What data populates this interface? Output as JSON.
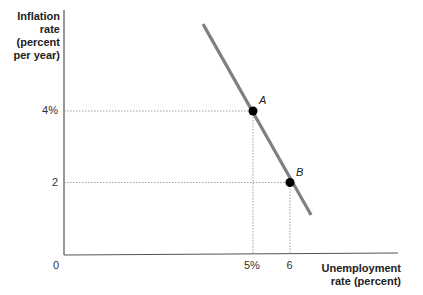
{
  "chart_data": {
    "type": "line",
    "title": "",
    "ylabel": "Inflation rate (percent per year)",
    "ylabel_lines": [
      "Inflation",
      "rate",
      "(percent",
      "per year)"
    ],
    "xlabel": "Unemployment rate (percent)",
    "xlabel_lines": [
      "Unemployment",
      "rate (percent)"
    ],
    "origin_label": "0",
    "x_ticks": [
      {
        "value": 5,
        "label": "5%"
      },
      {
        "value": 6,
        "label": "6"
      }
    ],
    "y_ticks": [
      {
        "value": 4,
        "label": "4%"
      },
      {
        "value": 2,
        "label": "2"
      }
    ],
    "series": [
      {
        "name": "Phillips curve",
        "color": "#808080",
        "x": [
          3.65,
          6.57
        ],
        "y": [
          6.43,
          1.09
        ]
      }
    ],
    "points": [
      {
        "label": "A",
        "x": 5,
        "y": 4
      },
      {
        "label": "B",
        "x": 6,
        "y": 2
      }
    ],
    "grid": false,
    "guide_lines": "dotted lines from points A and B to both axes"
  },
  "colors": {
    "axis": "#555555",
    "curve": "#808080",
    "point": "#000000",
    "guide": "#888888"
  }
}
